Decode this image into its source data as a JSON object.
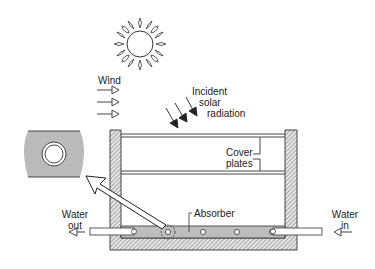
{
  "diagram": {
    "labels": {
      "wind": "Wind",
      "incident_line1": "Incident",
      "incident_line2": "solar",
      "incident_line3": "radiation",
      "cover_line1": "Cover",
      "cover_line2": "plates",
      "absorber": "Absorber",
      "water_out_line1": "Water",
      "water_out_line2": "out",
      "water_in_line1": "Water",
      "water_in_line2": "in"
    },
    "icons": [
      "sun-icon",
      "wind-arrow-icon",
      "radiation-arrow-icon",
      "flow-arrow-icon",
      "tube-detail-icon"
    ],
    "colors": {
      "line": "#333333",
      "absorber_fill": "#bdbdbd",
      "detail_fill": "#bababa",
      "hatch": "#555555"
    }
  }
}
